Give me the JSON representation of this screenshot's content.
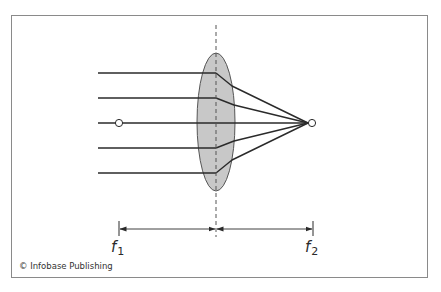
{
  "figure": {
    "type": "optics-diagram",
    "colors": {
      "frame": "#8a8a8a",
      "ray": "#2a2a2a",
      "lens_fill": "#c8c8c8",
      "lens_stroke": "#555555",
      "axis_dash": "#555555",
      "focal_point_fill": "#ffffff"
    }
  },
  "labels": {
    "f1_main": "f",
    "f1_sub": "1",
    "f2_main": "f",
    "f2_sub": "2"
  },
  "rays": {
    "count": 5,
    "y_positions": [
      73,
      98,
      123,
      148,
      173
    ]
  },
  "focal_points": [
    {
      "name": "f1",
      "x": 119,
      "y": 123
    },
    {
      "name": "f2",
      "x": 312,
      "y": 123
    }
  ],
  "dimension_arrows": [
    {
      "from": "f1",
      "to": "lens-center"
    },
    {
      "from": "lens-center",
      "to": "f2"
    }
  ],
  "credit": {
    "text": "© Infobase Publishing"
  }
}
